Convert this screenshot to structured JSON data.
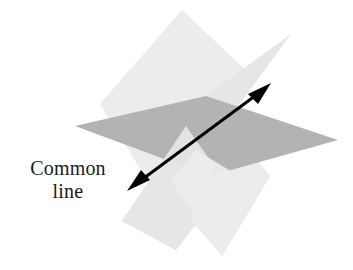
{
  "figure": {
    "background_color": "#ffffff",
    "width": 353,
    "height": 270,
    "labels": {
      "common_line": {
        "line1": "Common",
        "line2": "line",
        "color": "#1a1a1a",
        "x": 68,
        "y1": 174,
        "y2": 197
      }
    },
    "colors": {
      "plane_light": "#ececec",
      "plane_light_alt": "#e6e6e6",
      "plane_light_overlap": "#e0e0e0",
      "plane_dark": "#b3b3b3",
      "plane_dark_shadow": "#a8a8a8",
      "arrow": "#000000",
      "text": "#1a1a1a"
    },
    "planes": [
      {
        "name": "light-plane-upper-left",
        "fill": "#ececec",
        "points": "182,10 252,76 152,188 100,104"
      },
      {
        "name": "light-plane-upper-right",
        "fill": "#e6e6e6",
        "points": "291,34 225,124 137,222 206,96"
      },
      {
        "name": "light-plane-lower-left",
        "fill": "#e6e6e6",
        "points": "122,221 206,96 246,160 176,250"
      },
      {
        "name": "light-plane-lower-right",
        "fill": "#ececec",
        "points": "222,256 154,178 206,96 270,176"
      },
      {
        "name": "dark-plane-horizontal",
        "fill": "#b3b3b3",
        "points": "75,126 206,96 338,140 210,176"
      }
    ],
    "arrow": {
      "name": "common-line-arrow",
      "stroke": "#000000",
      "stroke_width": 3,
      "start_x": 131,
      "start_y": 188,
      "end_x": 268,
      "end_y": 86,
      "double_headed": true,
      "head_length": 17,
      "head_half_width": 6
    }
  }
}
